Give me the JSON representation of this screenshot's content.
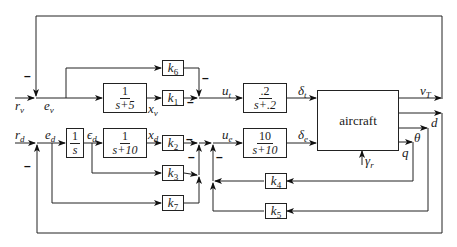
{
  "diagram": {
    "signals": {
      "r_v": "r",
      "r_v_sub": "v",
      "e_v": "e",
      "e_v_sub": "v",
      "x_v": "x",
      "x_v_sub": "v",
      "u_t": "u",
      "u_t_sub": "t",
      "delta_t": "δ",
      "delta_t_sub": "t",
      "v_T": "v",
      "v_T_sub": "T",
      "d": "d",
      "theta": "θ",
      "q": "q",
      "gamma_r": "γ",
      "gamma_r_sub": "r",
      "r_d": "r",
      "r_d_sub": "d",
      "e_d": "e",
      "e_d_sub": "d",
      "eps_d": "ϵ",
      "eps_d_sub": "d",
      "x_d": "x",
      "x_d_sub": "d",
      "u_e": "u",
      "u_e_sub": "e",
      "delta_e": "δ",
      "delta_e_sub": "e"
    },
    "blocks": {
      "tf_v": {
        "num": "1",
        "den": "s+5"
      },
      "tf_t": {
        "num": ".2",
        "den": "s+.2"
      },
      "integrator": {
        "num": "1",
        "den": "s"
      },
      "tf_d": {
        "num": "1",
        "den": "s+10"
      },
      "tf_e": {
        "num": "10",
        "den": "s+10"
      },
      "aircraft": {
        "label": "aircraft"
      },
      "k1": {
        "k": "k",
        "sub": "1"
      },
      "k2": {
        "k": "k",
        "sub": "2"
      },
      "k3": {
        "k": "k",
        "sub": "3"
      },
      "k4": {
        "k": "k",
        "sub": "4"
      },
      "k5": {
        "k": "k",
        "sub": "5"
      },
      "k6": {
        "k": "k",
        "sub": "6"
      },
      "k7": {
        "k": "k",
        "sub": "7"
      }
    },
    "sign_marks": {
      "minus": "–"
    }
  }
}
